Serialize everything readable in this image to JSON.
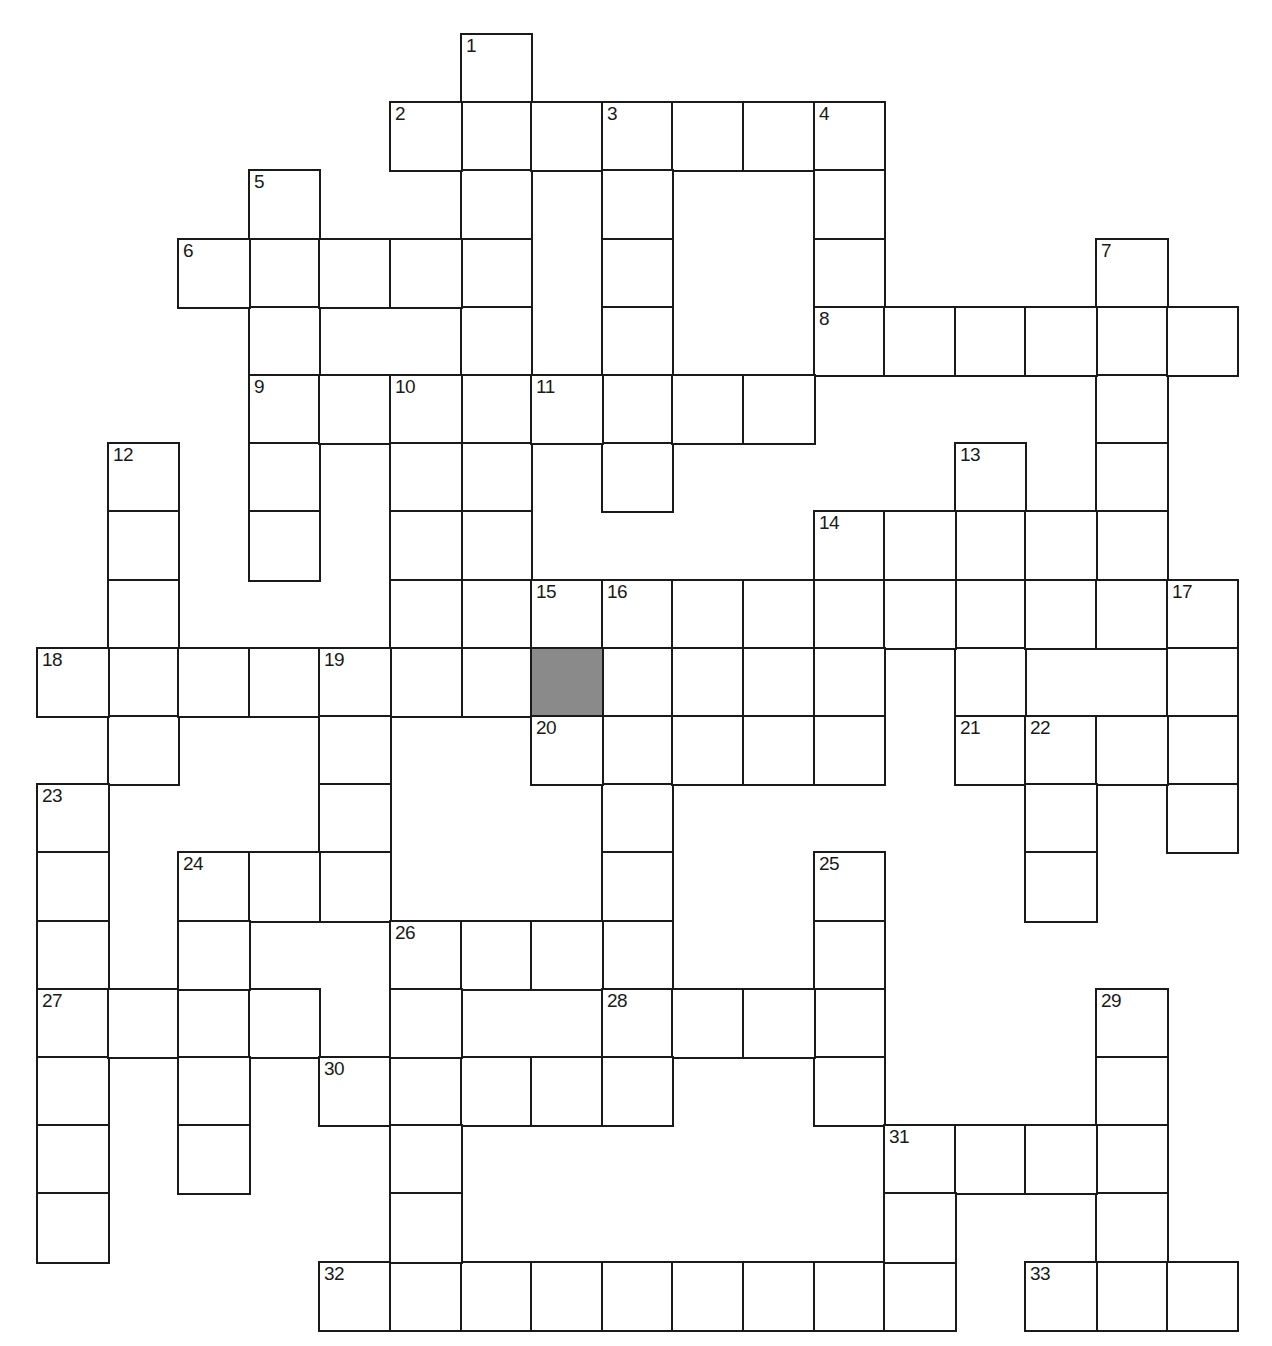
{
  "puzzle": {
    "type": "crossword",
    "grid": {
      "origin_x": 37,
      "origin_y": 34,
      "cell_w": 70.6,
      "cell_h": 68.2
    },
    "colors": {
      "line": "#1a1a1a",
      "cell": "#ffffff",
      "shaded": "#8a8a8a"
    },
    "words": [
      {
        "num": "1",
        "dir": "down",
        "col": 6,
        "row": 0,
        "len": 10
      },
      {
        "num": "2",
        "dir": "across",
        "col": 5,
        "row": 1,
        "len": 7
      },
      {
        "num": "3",
        "dir": "down",
        "col": 8,
        "row": 1,
        "len": 6
      },
      {
        "num": "4",
        "dir": "down",
        "col": 11,
        "row": 1,
        "len": 4
      },
      {
        "num": "5",
        "dir": "down",
        "col": 3,
        "row": 2,
        "len": 6
      },
      {
        "num": "6",
        "dir": "across",
        "col": 2,
        "row": 3,
        "len": 5
      },
      {
        "num": "7",
        "dir": "down",
        "col": 15,
        "row": 3,
        "len": 5
      },
      {
        "num": "8",
        "dir": "across",
        "col": 11,
        "row": 4,
        "len": 6
      },
      {
        "num": "9",
        "dir": "across",
        "col": 3,
        "row": 5,
        "len": 4
      },
      {
        "num": "10",
        "dir": "down",
        "col": 5,
        "row": 5,
        "len": 5
      },
      {
        "num": "11",
        "dir": "across",
        "col": 7,
        "row": 5,
        "len": 4
      },
      {
        "num": "12",
        "dir": "down",
        "col": 1,
        "row": 6,
        "len": 5
      },
      {
        "num": "13",
        "dir": "down",
        "col": 13,
        "row": 6,
        "len": 5
      },
      {
        "num": "14",
        "dir": "across",
        "col": 11,
        "row": 7,
        "len": 5
      },
      {
        "num": "15",
        "dir": "across",
        "col": 7,
        "row": 8,
        "len": 10
      },
      {
        "num": "16",
        "dir": "down",
        "col": 8,
        "row": 8,
        "len": 6
      },
      {
        "num": "17",
        "dir": "down",
        "col": 16,
        "row": 8,
        "len": 4
      },
      {
        "num": "18",
        "dir": "across",
        "col": 0,
        "row": 9,
        "len": 12
      },
      {
        "num": "19",
        "dir": "down",
        "col": 4,
        "row": 9,
        "len": 4
      },
      {
        "num": "20",
        "dir": "across",
        "col": 7,
        "row": 10,
        "len": 5
      },
      {
        "num": "21",
        "dir": "across",
        "col": 13,
        "row": 10,
        "len": 4
      },
      {
        "num": "22",
        "dir": "down",
        "col": 14,
        "row": 10,
        "len": 3
      },
      {
        "num": "23",
        "dir": "down",
        "col": 0,
        "row": 11,
        "len": 7
      },
      {
        "num": "24",
        "dir": "across",
        "col": 2,
        "row": 12,
        "len": 3
      },
      {
        "num": "25",
        "dir": "down",
        "col": 11,
        "row": 12,
        "len": 4
      },
      {
        "num": "26",
        "dir": "across",
        "col": 5,
        "row": 13,
        "len": 4
      },
      {
        "num": "27",
        "dir": "across",
        "col": 0,
        "row": 14,
        "len": 4
      },
      {
        "num": "28",
        "dir": "across",
        "col": 8,
        "row": 14,
        "len": 4
      },
      {
        "num": "29",
        "dir": "down",
        "col": 15,
        "row": 14,
        "len": 5
      },
      {
        "num": "30",
        "dir": "across",
        "col": 4,
        "row": 15,
        "len": 5
      },
      {
        "num": "31",
        "dir": "across",
        "col": 12,
        "row": 16,
        "len": 4
      },
      {
        "num": "32",
        "dir": "across",
        "col": 4,
        "row": 18,
        "len": 9
      },
      {
        "num": "33",
        "dir": "across",
        "col": 14,
        "row": 18,
        "len": 3
      }
    ],
    "extra_cells": [
      [
        2,
        12
      ],
      [
        2,
        13
      ],
      [
        2,
        14
      ],
      [
        2,
        15
      ],
      [
        2,
        16
      ],
      [
        5,
        13
      ],
      [
        5,
        14
      ],
      [
        5,
        15
      ],
      [
        5,
        16
      ],
      [
        5,
        17
      ],
      [
        12,
        16
      ],
      [
        12,
        17
      ],
      [
        12,
        18
      ],
      [
        11,
        7
      ],
      [
        11,
        8
      ],
      [
        11,
        9
      ],
      [
        11,
        10
      ],
      [
        3,
        5
      ],
      [
        3,
        6
      ],
      [
        3,
        7
      ]
    ],
    "shaded_cells": [
      [
        7,
        9
      ]
    ]
  }
}
